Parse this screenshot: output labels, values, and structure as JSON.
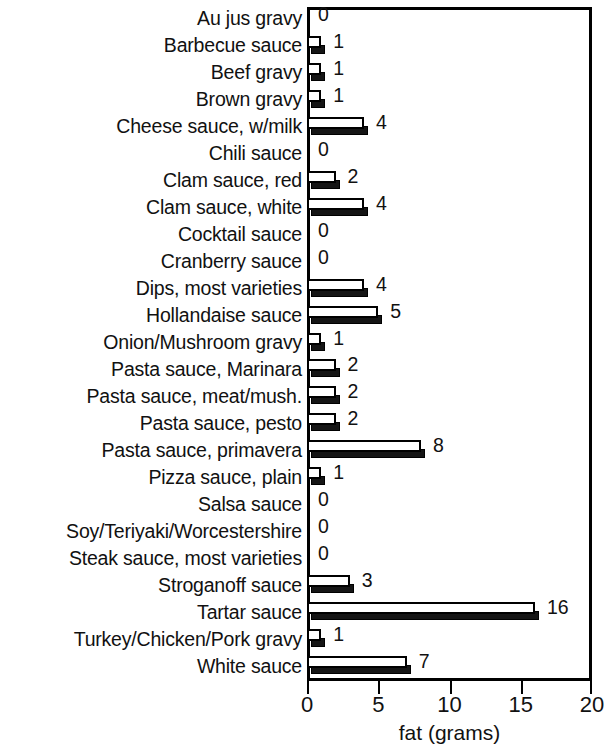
{
  "chart_data": {
    "type": "bar",
    "orientation": "horizontal",
    "title": "",
    "xlabel": "fat (grams)",
    "ylabel": "",
    "xlim": [
      0,
      20
    ],
    "xticks": [
      0,
      5,
      10,
      15,
      20
    ],
    "xticklabels": [
      "0",
      "5",
      "10",
      "15",
      "20"
    ],
    "grid": false,
    "legend": null,
    "value_labels_shown": true,
    "categories": [
      "Au jus gravy",
      "Barbecue sauce",
      "Beef gravy",
      "Brown gravy",
      "Cheese sauce, w/milk",
      "Chili sauce",
      "Clam sauce, red",
      "Clam sauce, white",
      "Cocktail sauce",
      "Cranberry sauce",
      "Dips, most varieties",
      "Hollandaise sauce",
      "Onion/Mushroom gravy",
      "Pasta sauce, Marinara",
      "Pasta sauce, meat/mush.",
      "Pasta sauce, pesto",
      "Pasta sauce, primavera",
      "Pizza sauce, plain",
      "Salsa sauce",
      "Soy/Teriyaki/Worcestershire",
      "Steak sauce, most varieties",
      "Stroganoff sauce",
      "Tartar sauce",
      "Turkey/Chicken/Pork gravy",
      "White sauce"
    ],
    "values": [
      0,
      1,
      1,
      1,
      4,
      0,
      2,
      4,
      0,
      0,
      4,
      5,
      1,
      2,
      2,
      2,
      8,
      1,
      0,
      0,
      0,
      3,
      16,
      1,
      7
    ],
    "value_labels": [
      "0",
      "1",
      "1",
      "1",
      "4",
      "0",
      "2",
      "4",
      "0",
      "0",
      "4",
      "5",
      "1",
      "2",
      "2",
      "2",
      "8",
      "1",
      "0",
      "0",
      "0",
      "3",
      "16",
      "1",
      "7"
    ],
    "colors": {
      "bar_face": "#ffffff",
      "bar_outline": "#000000",
      "bar_shadow": "#151515",
      "axis": "#000000",
      "text": "#111111",
      "background": "#ffffff"
    }
  }
}
